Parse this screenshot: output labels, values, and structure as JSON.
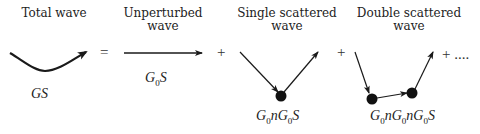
{
  "terms": [
    {
      "title_lines": [
        "Total wave"
      ],
      "expression": {
        "parts": [
          "GS"
        ]
      }
    },
    {
      "title_lines": [
        "Unperturbed",
        "wave"
      ],
      "expression": {
        "parts": [
          "G",
          "0",
          "S"
        ]
      }
    },
    {
      "title_lines": [
        "Single scattered",
        "wave"
      ],
      "expression": {
        "parts": [
          "G",
          "0",
          "nG",
          "0",
          "S"
        ]
      }
    },
    {
      "title_lines": [
        "Double scattered",
        "wave"
      ],
      "expression": {
        "parts": [
          "G",
          "0",
          "nG",
          "0",
          "nG",
          "0",
          "S"
        ]
      }
    }
  ],
  "operators": {
    "equals": "=",
    "plus1": "+",
    "plus2": "+",
    "plus3": "+ ...."
  },
  "colors": {
    "ink": "#1a1a1a",
    "text": "#222222"
  }
}
